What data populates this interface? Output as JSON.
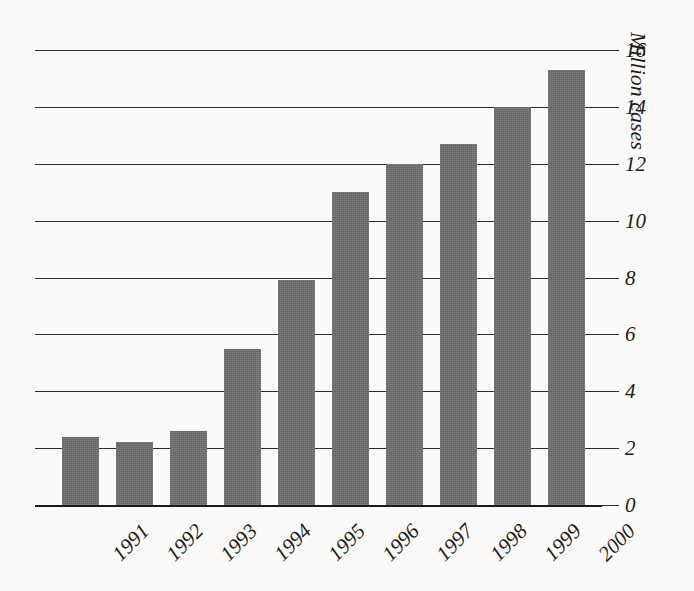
{
  "chart_data": {
    "type": "bar",
    "title": "",
    "xlabel": "",
    "ylabel": "Million cases",
    "categories": [
      "1991",
      "1992",
      "1993",
      "1994",
      "1995",
      "1996",
      "1997",
      "1998",
      "1999",
      "2000"
    ],
    "values": [
      2.4,
      2.2,
      2.6,
      5.5,
      7.9,
      11.0,
      12.0,
      12.7,
      14.0,
      15.3
    ],
    "ylim": [
      0,
      16
    ],
    "ytick_labels": [
      "0",
      "2",
      "4",
      "6",
      "8",
      "10",
      "12",
      "14",
      "16"
    ],
    "ytick_values": [
      0,
      2,
      4,
      6,
      8,
      10,
      12,
      14,
      16
    ],
    "grid": true,
    "legend": "none",
    "bar_color": "#6f6d6c",
    "axis_color": "#2e2c2b",
    "background_color": "#fbfaf8"
  }
}
